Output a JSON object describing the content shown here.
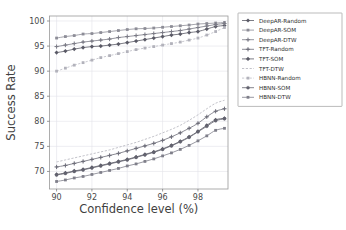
{
  "chart_data": {
    "type": "line",
    "title": "",
    "xlabel": "Confidence level (%)",
    "ylabel": "Success Rate",
    "xlim": [
      89.6,
      99.7
    ],
    "ylim": [
      66.5,
      101.0
    ],
    "xticks": [
      90,
      92,
      94,
      96,
      98
    ],
    "yticks": [
      70,
      75,
      80,
      85,
      90,
      95,
      100
    ],
    "grid": true,
    "legend_position": "right-outside",
    "x": [
      90.0,
      90.5,
      91.0,
      91.5,
      92.0,
      92.5,
      93.0,
      93.5,
      94.0,
      94.5,
      95.0,
      95.5,
      96.0,
      96.5,
      97.0,
      97.5,
      98.0,
      98.5,
      99.0,
      99.5
    ],
    "series": [
      {
        "name": "DeepAR-Random",
        "marker": "diamond",
        "linestyle": "solid",
        "color": "#5a5a66",
        "values": [
          93.7,
          94.0,
          94.4,
          94.7,
          94.9,
          95.0,
          95.2,
          95.4,
          95.7,
          96.0,
          96.3,
          96.6,
          96.9,
          97.2,
          97.4,
          97.7,
          97.9,
          98.4,
          98.9,
          99.1
        ]
      },
      {
        "name": "DeepAR-SOM",
        "marker": "square",
        "linestyle": "solid",
        "color": "#8d8d97",
        "values": [
          96.6,
          96.9,
          97.1,
          97.4,
          97.5,
          97.7,
          97.9,
          98.1,
          98.3,
          98.45,
          98.5,
          98.6,
          98.75,
          98.9,
          99.05,
          99.2,
          99.4,
          99.5,
          99.6,
          99.7
        ]
      },
      {
        "name": "DeepAR-DTW",
        "marker": "plus",
        "linestyle": "solid",
        "color": "#7b7b86",
        "values": [
          94.9,
          95.2,
          95.5,
          95.8,
          96.0,
          96.2,
          96.4,
          96.7,
          96.9,
          97.1,
          97.3,
          97.5,
          97.7,
          97.9,
          98.1,
          98.4,
          98.7,
          99.0,
          99.3,
          99.5
        ]
      },
      {
        "name": "TFT-Random",
        "marker": "plus",
        "linestyle": "solid",
        "color": "#6e6e7a",
        "values": [
          70.9,
          71.2,
          71.6,
          72.0,
          72.4,
          72.8,
          73.2,
          73.6,
          74.1,
          74.6,
          75.1,
          75.6,
          76.2,
          76.9,
          77.7,
          78.6,
          79.6,
          80.9,
          82.0,
          82.5
        ]
      },
      {
        "name": "TFT-SOM",
        "marker": "diamond",
        "linestyle": "solid",
        "color": "#5a5a66",
        "values": [
          69.4,
          69.7,
          70.1,
          70.4,
          70.8,
          71.2,
          71.6,
          72.0,
          72.4,
          72.9,
          73.4,
          73.9,
          74.5,
          75.2,
          76.0,
          76.9,
          78.0,
          79.2,
          80.3,
          80.6
        ]
      },
      {
        "name": "TFT-DTW",
        "marker": "none",
        "linestyle": "dashed",
        "color": "#a8a8b2",
        "values": [
          71.9,
          72.3,
          72.7,
          73.1,
          73.5,
          73.9,
          74.3,
          74.8,
          75.3,
          75.8,
          76.4,
          77.0,
          77.7,
          78.4,
          79.2,
          80.2,
          81.3,
          82.5,
          83.6,
          84.2
        ]
      },
      {
        "name": "HBNN-Random",
        "marker": "square",
        "linestyle": "dashed",
        "color": "#b2b2bb",
        "values": [
          90.0,
          90.6,
          91.2,
          91.7,
          92.2,
          92.7,
          93.1,
          93.5,
          93.9,
          94.3,
          94.6,
          94.9,
          95.2,
          95.5,
          95.8,
          96.2,
          96.6,
          97.2,
          97.9,
          98.7
        ]
      },
      {
        "name": "HBNN-SOM",
        "marker": "circle",
        "linestyle": "solid",
        "color": "#63636f",
        "values": [
          69.3,
          69.6,
          70.0,
          70.3,
          70.7,
          71.1,
          71.5,
          71.9,
          72.3,
          72.8,
          73.3,
          73.8,
          74.4,
          75.1,
          75.9,
          76.8,
          77.9,
          79.0,
          80.1,
          80.5
        ]
      },
      {
        "name": "HBNN-DTW",
        "marker": "square",
        "linestyle": "solid",
        "color": "#7f7f8a",
        "values": [
          68.0,
          68.3,
          68.7,
          69.0,
          69.4,
          69.8,
          70.2,
          70.6,
          71.1,
          71.5,
          72.0,
          72.5,
          73.1,
          73.7,
          74.4,
          75.2,
          76.1,
          77.1,
          78.2,
          78.6
        ]
      }
    ]
  },
  "legend": {
    "entries": [
      "DeepAR-Random",
      "DeepAR-SOM",
      "DeepAR-DTW",
      "TFT-Random",
      "TFT-SOM",
      "TFT-DTW",
      "HBNN-Random",
      "HBNN-SOM",
      "HBNN-DTW"
    ]
  }
}
